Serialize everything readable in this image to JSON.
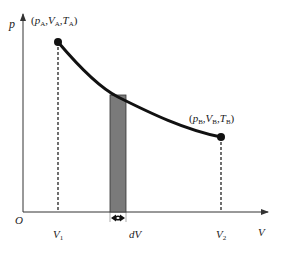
{
  "diagram": {
    "axes": {
      "y_label": "p",
      "x_label": "V",
      "origin_label": "O"
    },
    "state_a": {
      "label": "(pA,VA,TA)",
      "p": "p",
      "p_sub": "A",
      "v": "V",
      "v_sub": "A",
      "t": "T",
      "t_sub": "A"
    },
    "state_b": {
      "label": "(pB,VB,TB)",
      "p": "p",
      "p_sub": "B",
      "v": "V",
      "v_sub": "B",
      "t": "T",
      "t_sub": "B"
    },
    "ticks": {
      "v1": "V",
      "v1_sub": "1",
      "v2": "V",
      "v2_sub": "2"
    },
    "strip_label": "dV",
    "colors": {
      "curve": "#111111",
      "strip_fill": "#7a7a7a",
      "axis": "#333333"
    }
  }
}
